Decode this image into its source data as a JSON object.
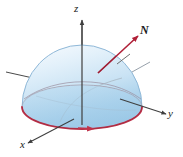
{
  "figure": {
    "type": "3d-diagram",
    "background_color": "#ffffff"
  },
  "axes": {
    "z": {
      "label": "z",
      "direction": "up",
      "arrow": true
    },
    "y": {
      "label": "y",
      "direction": "right",
      "arrow": true
    },
    "x": {
      "label": "x",
      "direction": "lower-left",
      "arrow": true
    },
    "negative_y": {
      "label": "",
      "direction": "left",
      "arrow": false
    },
    "color": "#4a4a4a"
  },
  "vector": {
    "label": "N",
    "description": "outward normal vector",
    "color": "#b02038",
    "arrow": true
  },
  "surface": {
    "name": "hemisphere",
    "fill_top_color": "#e8f2fb",
    "fill_bottom_color": "#a8cfe9",
    "edge_color": "#8fb8d8"
  },
  "boundary_curve": {
    "name": "boundary circle",
    "color": "#c0344c",
    "orientation_arrow": true,
    "arrow_direction": "counterclockwise-viewed-from-above"
  },
  "tangent_mark": {
    "name": "tangent plane tick",
    "color": "#6e6e6e"
  },
  "meridians": {
    "color": "#9aa7b4"
  }
}
